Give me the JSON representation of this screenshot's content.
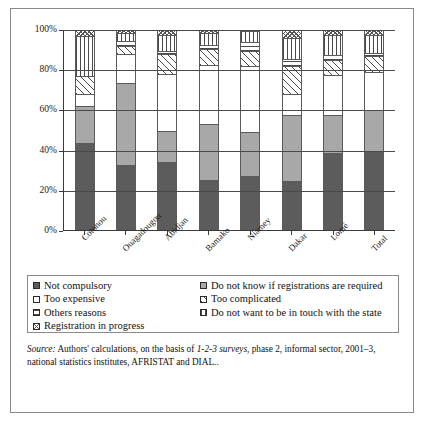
{
  "chart_data": {
    "type": "bar",
    "subtype": "100% stacked column",
    "title": "",
    "xlabel": "",
    "ylabel": "",
    "ylim": [
      0,
      100
    ],
    "ytick_labels": [
      "0%",
      "20%",
      "40%",
      "60%",
      "80%",
      "100%"
    ],
    "ytick_values": [
      0,
      20,
      40,
      60,
      80,
      100
    ],
    "grid": true,
    "legend_position": "below plot",
    "categories": [
      "Cotonou",
      "Ouagadougou",
      "Abidjan",
      "Bamako",
      "Niamey",
      "Dakar",
      "Lomé",
      "Total"
    ],
    "series": [
      {
        "name": "Not compulsory",
        "pattern": "solid-dark-gray",
        "values": [
          43.5,
          32.5,
          34,
          25,
          27,
          24.5,
          38.5,
          39
        ]
      },
      {
        "name": "Do not know if registrations are required",
        "pattern": "solid-mid-gray",
        "values": [
          18.5,
          41,
          15.5,
          28,
          22,
          33,
          19,
          21
        ]
      },
      {
        "name": "Too expensive",
        "pattern": "white",
        "values": [
          6,
          14.5,
          28.5,
          29.5,
          33,
          10.5,
          20,
          19
        ]
      },
      {
        "name": "Too complicated",
        "pattern": "diagonal-hatch",
        "values": [
          9,
          4,
          10,
          8,
          7.5,
          14,
          7.5,
          8
        ]
      },
      {
        "name": "Others reasons",
        "pattern": "horizontal-lines",
        "values": [
          0,
          2.5,
          1.5,
          2,
          4.5,
          3.5,
          2.5,
          1.5
        ]
      },
      {
        "name": "Do not want to be in touch with the state",
        "pattern": "vertical-lines",
        "values": [
          20,
          4,
          8,
          6,
          5.5,
          10.5,
          10,
          9
        ]
      },
      {
        "name": "Registration in progress",
        "pattern": "checkerboard",
        "values": [
          3,
          1.5,
          2.5,
          1.5,
          0.5,
          4,
          2.5,
          2.5
        ]
      }
    ]
  },
  "legend": {
    "left_column": [
      {
        "label": "Not compulsory",
        "pattern": "solid-dark-gray"
      },
      {
        "label": "Too expensive",
        "pattern": "white"
      },
      {
        "label": "Others reasons",
        "pattern": "horizontal-lines"
      },
      {
        "label": "Registration in progress",
        "pattern": "checkerboard"
      }
    ],
    "right_column": [
      {
        "label": "Do not know if registrations are required",
        "pattern": "solid-mid-gray"
      },
      {
        "label": "Too complicated",
        "pattern": "diagonal-hatch"
      },
      {
        "label": "Do not want to be in touch with the state",
        "pattern": "vertical-lines"
      }
    ]
  },
  "source": {
    "label": "Source:",
    "text_before_italic": " Authors' calculations, on the basis of ",
    "italic_phrase": "1-2-3 surveys",
    "text_after_italic": ", phase 2, informal sector, 2001–3, national statistics institutes, AFRISTAT and DIAL.."
  }
}
